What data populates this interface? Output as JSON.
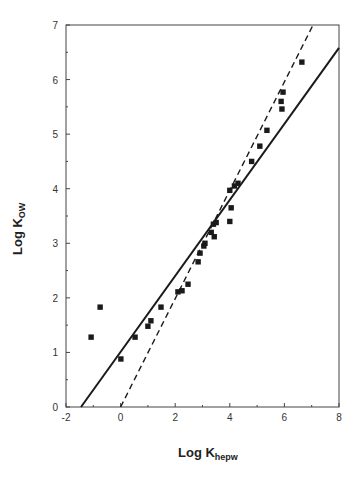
{
  "header_fragment": "",
  "chart_data": {
    "type": "scatter",
    "title": "",
    "xlabel": "Log K",
    "xlabel_sub": "hepw",
    "ylabel": "Log K",
    "ylabel_sub": "OW",
    "xlim": [
      -2,
      8
    ],
    "ylim": [
      0,
      7
    ],
    "xticks": [
      -2,
      0,
      2,
      4,
      6,
      8
    ],
    "yticks": [
      0,
      1,
      2,
      3,
      4,
      5,
      6,
      7
    ],
    "grid": false,
    "legend": null,
    "series": [
      {
        "name": "data",
        "kind": "points",
        "marker": "square",
        "color": "#1a1a1a",
        "points": [
          [
            -1.08,
            1.28
          ],
          [
            -0.75,
            1.83
          ],
          [
            0.01,
            0.88
          ],
          [
            0.53,
            1.28
          ],
          [
            1.0,
            1.48
          ],
          [
            1.11,
            1.58
          ],
          [
            1.48,
            1.83
          ],
          [
            2.1,
            2.11
          ],
          [
            2.25,
            2.13
          ],
          [
            2.47,
            2.25
          ],
          [
            2.84,
            2.66
          ],
          [
            2.91,
            2.82
          ],
          [
            3.05,
            2.95
          ],
          [
            3.09,
            3.0
          ],
          [
            3.32,
            3.2
          ],
          [
            3.43,
            3.12
          ],
          [
            3.4,
            3.35
          ],
          [
            3.5,
            3.38
          ],
          [
            4.0,
            3.4
          ],
          [
            4.05,
            3.65
          ],
          [
            4.0,
            3.97
          ],
          [
            4.17,
            4.05
          ],
          [
            4.3,
            4.1
          ],
          [
            4.8,
            4.5
          ],
          [
            5.1,
            4.78
          ],
          [
            5.36,
            5.07
          ],
          [
            5.91,
            5.46
          ],
          [
            5.88,
            5.6
          ],
          [
            5.95,
            5.77
          ],
          [
            6.64,
            6.32
          ]
        ]
      },
      {
        "name": "regression fit",
        "kind": "line",
        "style": "solid",
        "color": "#1a1a1a",
        "points": [
          [
            -1.45,
            0.0
          ],
          [
            8.0,
            6.58
          ]
        ]
      },
      {
        "name": "1:1 line",
        "kind": "line",
        "style": "dashed",
        "color": "#1a1a1a",
        "points": [
          [
            0.0,
            0.0
          ],
          [
            7.05,
            7.0
          ]
        ]
      }
    ]
  }
}
